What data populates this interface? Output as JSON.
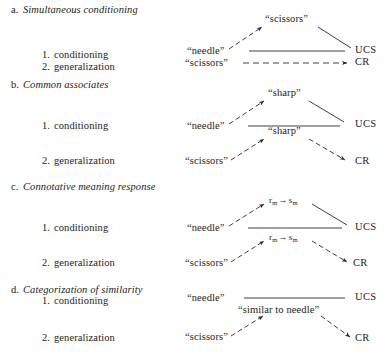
{
  "figure": {
    "type": "conditioning-generalization-diagram",
    "line_color": "#2a2a2a",
    "background": "#ffffff"
  },
  "sections": [
    {
      "letter": "a.",
      "title": "Simultaneous conditioning",
      "rows": [
        {
          "number": "1.",
          "label": "conditioning",
          "source": "“needle”",
          "target": "UCS"
        },
        {
          "number": "2.",
          "label": "generalization",
          "source": "“scissors”",
          "target": "CR"
        }
      ],
      "apex": "“scissors”"
    },
    {
      "letter": "b.",
      "title": "Common associates",
      "rows": [
        {
          "number": "1.",
          "label": "conditioning",
          "source": "“needle”",
          "target": "UCS",
          "apex": "“sharp”"
        },
        {
          "number": "2.",
          "label": "generalization",
          "source": "“scissors”",
          "target": "CR",
          "apex": "“sharp”"
        }
      ]
    },
    {
      "letter": "c.",
      "title": "Connotative meaning response",
      "rows": [
        {
          "number": "1.",
          "label": "conditioning",
          "source": "“needle”",
          "target": "UCS",
          "apex": "rm-sm"
        },
        {
          "number": "2.",
          "label": "generalization",
          "source": "“scissors”",
          "target": "CR",
          "apex": "rm-sm"
        }
      ],
      "mediator": {
        "r": "r",
        "r_sub": "m",
        "arrow": "→",
        "s": "s",
        "s_sub": "m"
      }
    },
    {
      "letter": "d.",
      "title": "Categorization of similarity",
      "rows": [
        {
          "number": "1.",
          "label": "conditioning",
          "source": "“needle”",
          "target": "UCS"
        },
        {
          "number": "2.",
          "label": "generalization",
          "source": "“scissors”",
          "target": "CR"
        }
      ],
      "apex": "“similar to needle”"
    }
  ]
}
